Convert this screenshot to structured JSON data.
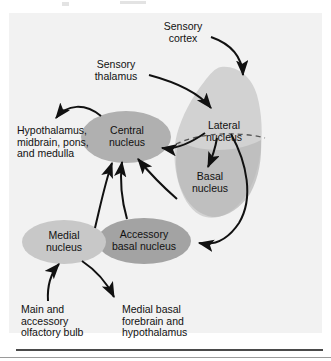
{
  "figure": {
    "background_color": "#f2f2f2",
    "page_color": "#ffffff"
  },
  "colors": {
    "amygdala_body": "#d2d2d2",
    "basal_region": "#b8b8b8",
    "central_nucleus": "#b0b0b0",
    "accessory_basal_nucleus": "#a3a3a3",
    "medial_nucleus": "#c8c8c8",
    "arrow": "#111111",
    "dashed_divider": "#555555",
    "text": "#111111"
  },
  "labels": {
    "sensory_cortex": "Sensory\ncortex",
    "sensory_thalamus": "Sensory\nthalamus",
    "lateral_nucleus": "Lateral\nnucleus",
    "basal_nucleus": "Basal\nnucleus",
    "central_nucleus": "Central\nnucleus",
    "accessory_basal_nucleus": "Accessory\nbasal nucleus",
    "medial_nucleus": "Medial\nnucleus",
    "hypothalamus_output": "Hypothalamus,\nmidbrain, pons,\nand medulla",
    "olfactory_bulb": "Main and\naccessory\nolfactory bulb",
    "forebrain_output": "Medial basal\nforebrain and\nhypothalamus"
  },
  "connections": [
    {
      "from": "sensory_cortex",
      "to": "lateral_nucleus",
      "direction": "in"
    },
    {
      "from": "sensory_thalamus",
      "to": "lateral_nucleus",
      "direction": "in"
    },
    {
      "from": "lateral_nucleus",
      "to": "basal_nucleus",
      "direction": "down"
    },
    {
      "from": "lateral_nucleus",
      "to": "central_nucleus",
      "direction": "left"
    },
    {
      "from": "lateral_nucleus",
      "to": "accessory_basal_nucleus",
      "direction": "down-right"
    },
    {
      "from": "basal_nucleus",
      "to": "central_nucleus",
      "direction": "up-left"
    },
    {
      "from": "accessory_basal_nucleus",
      "to": "central_nucleus",
      "direction": "up"
    },
    {
      "from": "central_nucleus",
      "to": "hypothalamus_output",
      "direction": "out"
    },
    {
      "from": "olfactory_bulb",
      "to": "medial_nucleus",
      "direction": "in"
    },
    {
      "from": "medial_nucleus",
      "to": "forebrain_output",
      "direction": "out"
    }
  ]
}
